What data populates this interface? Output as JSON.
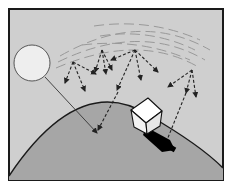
{
  "diagram": {
    "elements": {
      "sun": "sun",
      "earth": "earth-surface",
      "atmosphere": "scattering-layer",
      "house": "house",
      "shadow": "house-shadow"
    },
    "colors": {
      "frame": "#1a1a1a",
      "sky": "#cfcfcf",
      "sky_outer": "#ffffff",
      "ground": "#a6a6a6",
      "sun_fill": "#eeeeee",
      "sun_stroke": "#555555",
      "ray": "#222222",
      "haze": "#999999",
      "house_fill": "#ffffff",
      "shadow": "#000000"
    }
  }
}
